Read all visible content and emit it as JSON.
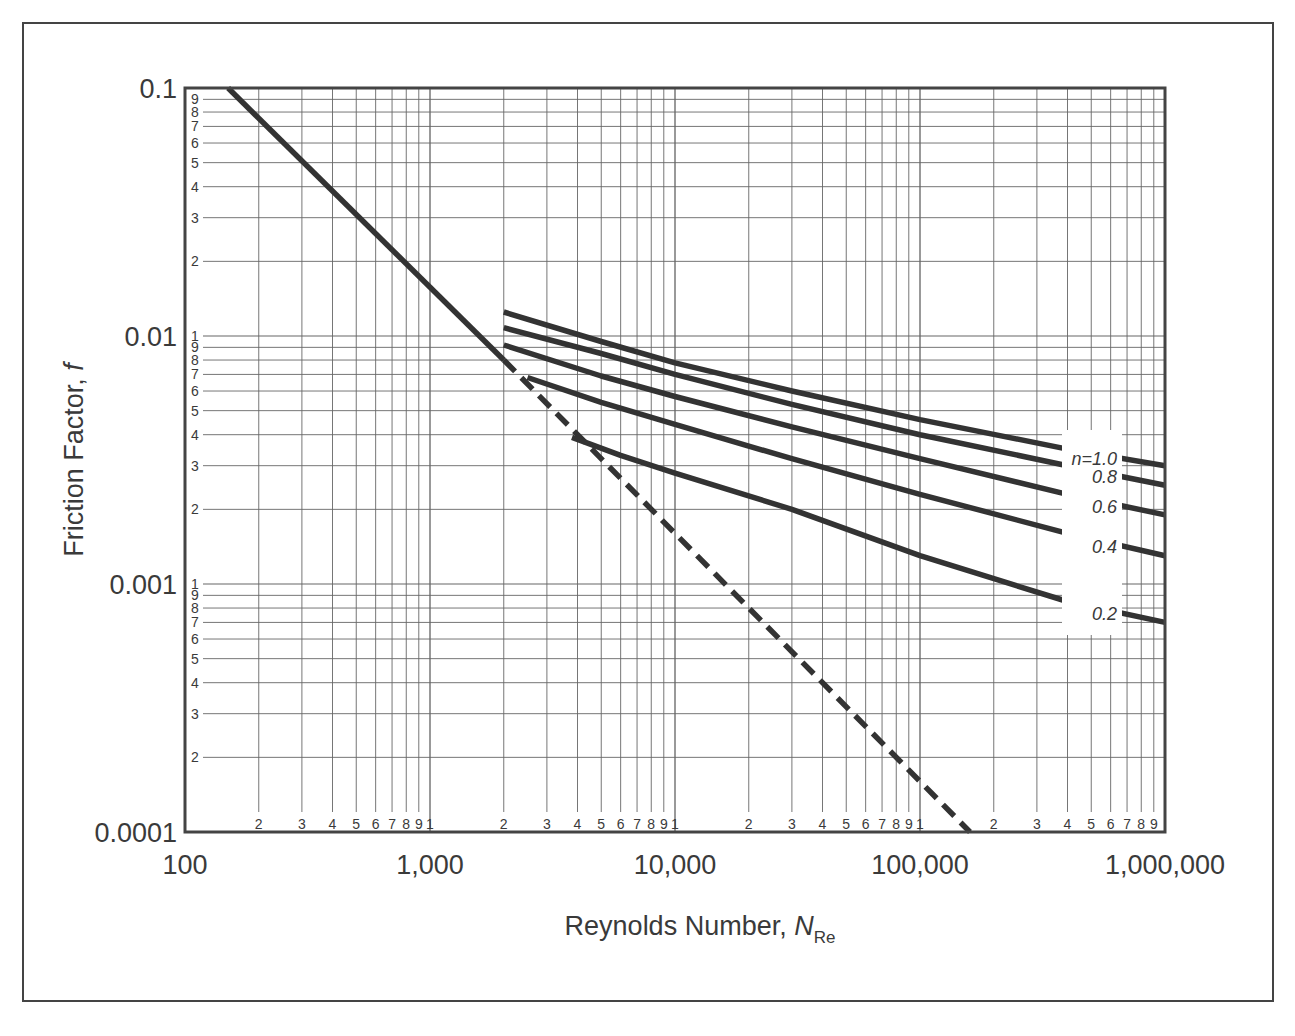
{
  "chart_data": {
    "type": "line",
    "title": "",
    "xlabel": "Reynolds Number, N_Re",
    "xlabel_main": "Reynolds Number, ",
    "xlabel_italic": "N",
    "xlabel_sub": "Re",
    "ylabel": "Friction Factor, f",
    "ylabel_main": "Friction Factor, ",
    "ylabel_italic": "f",
    "xscale": "log",
    "yscale": "log",
    "xlim": [
      100,
      1000000
    ],
    "ylim": [
      0.0001,
      0.1
    ],
    "grid": true,
    "x_major_ticks": [
      {
        "value": 100,
        "label": "100"
      },
      {
        "value": 1000,
        "label": "1,000"
      },
      {
        "value": 10000,
        "label": "10,000"
      },
      {
        "value": 100000,
        "label": "100,000"
      },
      {
        "value": 1000000,
        "label": "1,000,000"
      }
    ],
    "y_major_ticks": [
      {
        "value": 0.1,
        "label": "0.1"
      },
      {
        "value": 0.01,
        "label": "0.01"
      },
      {
        "value": 0.001,
        "label": "0.001"
      },
      {
        "value": 0.0001,
        "label": "0.0001"
      }
    ],
    "x_minor_tick_labels": [
      "2",
      "3",
      "4",
      "5",
      "6",
      "7",
      "8",
      "9",
      "1"
    ],
    "x_last_decade_minor_labels": [
      "2",
      "3",
      "4",
      "5",
      "6",
      "7",
      "8",
      "9"
    ],
    "y_minor_tick_labels_top": [
      "9",
      "8",
      "7",
      "6",
      "5",
      "4",
      "3",
      "2"
    ],
    "y_minor_tick_labels": [
      "1",
      "9",
      "8",
      "7",
      "6",
      "5",
      "4",
      "3",
      "2"
    ],
    "series": [
      {
        "name": "Laminar (16/N_Re)",
        "style": "solid",
        "x": [
          150,
          2000
        ],
        "y": [
          0.1,
          0.008
        ]
      },
      {
        "name": "Laminar extension",
        "style": "dashed",
        "x": [
          2000,
          160000
        ],
        "y": [
          0.008,
          0.0001
        ]
      },
      {
        "name": "n=1.0",
        "label": "n=1.0",
        "style": "solid",
        "x": [
          2000,
          5000,
          10000,
          30000,
          100000,
          400000,
          1000000
        ],
        "y": [
          0.0125,
          0.0095,
          0.0078,
          0.006,
          0.0046,
          0.0035,
          0.003
        ]
      },
      {
        "name": "n=0.8",
        "label": "0.8",
        "style": "solid",
        "x": [
          2000,
          5000,
          10000,
          30000,
          100000,
          400000,
          1000000
        ],
        "y": [
          0.0108,
          0.0085,
          0.007,
          0.0053,
          0.004,
          0.003,
          0.0025
        ]
      },
      {
        "name": "n=0.6",
        "label": "0.6",
        "style": "solid",
        "x": [
          2000,
          5000,
          10000,
          30000,
          100000,
          400000,
          1000000
        ],
        "y": [
          0.0092,
          0.0069,
          0.0057,
          0.0043,
          0.0032,
          0.0023,
          0.0019
        ]
      },
      {
        "name": "n=0.4",
        "label": "0.4",
        "style": "solid",
        "x": [
          2500,
          5000,
          10000,
          30000,
          100000,
          400000,
          1000000
        ],
        "y": [
          0.0068,
          0.0054,
          0.0044,
          0.0032,
          0.0023,
          0.0016,
          0.0013
        ]
      },
      {
        "name": "n=0.2",
        "label": "0.2",
        "style": "solid",
        "x": [
          3800,
          6000,
          10000,
          30000,
          100000,
          400000,
          1000000
        ],
        "y": [
          0.0039,
          0.0033,
          0.0028,
          0.002,
          0.0013,
          0.00085,
          0.0007
        ]
      }
    ],
    "curve_labels": [
      {
        "series": "n=1.0",
        "text_italic": "n",
        "text": "=1.0"
      },
      {
        "series": "n=0.8",
        "text_italic": "",
        "text": "0.8"
      },
      {
        "series": "n=0.6",
        "text_italic": "",
        "text": "0.6"
      },
      {
        "series": "n=0.4",
        "text_italic": "",
        "text": "0.4"
      },
      {
        "series": "n=0.2",
        "text_italic": "",
        "text": "0.2"
      }
    ],
    "legend": "none"
  }
}
